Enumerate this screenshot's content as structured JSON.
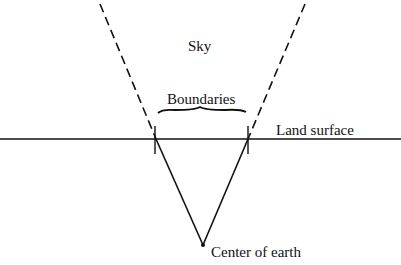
{
  "diagram": {
    "labels": {
      "sky": "Sky",
      "boundaries": "Boundaries",
      "land_surface": "Land surface",
      "center": "Center of earth"
    },
    "colors": {
      "line": "#111111",
      "background": "#ffffff"
    }
  }
}
